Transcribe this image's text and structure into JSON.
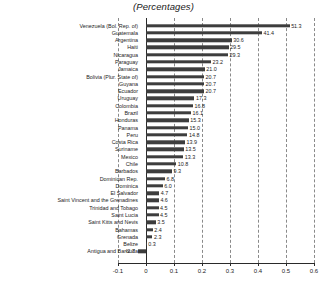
{
  "chart_data": {
    "type": "bar",
    "orientation": "horizontal",
    "title": "(Percentages)",
    "xlabel": "",
    "ylabel": "",
    "xlim": [
      -0.1,
      0.6
    ],
    "xticks": [
      "-0.1",
      "0",
      "0.1",
      "0.2",
      "0.3",
      "0.4",
      "0.5",
      "0.6"
    ],
    "xtick_values": [
      -0.1,
      0,
      0.1,
      0.2,
      0.3,
      0.4,
      0.5,
      0.6
    ],
    "grid": true,
    "legend": "none",
    "bar_color": "#3d3d3d",
    "categories": [
      "Venezuela (Bol. Rep. of)",
      "Guatemala",
      "Argentina",
      "Haiti",
      "Nicaragua",
      "Paraguay",
      "Jamaica",
      "Bolivia (Plur. State of)",
      "Guyana",
      "Ecuador",
      "Uruguay",
      "Colombia",
      "Brazil",
      "Honduras",
      "Panama",
      "Peru",
      "Costa Rica",
      "Suriname",
      "Mexico",
      "Chile",
      "Barbados",
      "Dominican Rep.",
      "Dominica",
      "El Salvador",
      "Saint Vincent and the Grenadines",
      "Trinidad and Tobago",
      "Saint Lucia",
      "Saint Kitts and Nevis",
      "Bahamas",
      "Grenada",
      "Belize",
      "Antigua and Barbuda"
    ],
    "values": [
      51.3,
      41.4,
      30.6,
      29.5,
      29.3,
      23.2,
      21.0,
      20.7,
      20.7,
      20.7,
      17.3,
      16.8,
      16.1,
      15.3,
      15.0,
      14.8,
      13.9,
      13.5,
      13.3,
      10.8,
      9.3,
      6.8,
      6.0,
      4.7,
      4.6,
      4.5,
      4.5,
      3.5,
      2.4,
      2.3,
      0.3,
      -2.7
    ],
    "value_labels": [
      "51.3",
      "41.4",
      "30.6",
      "29.5",
      "29.3",
      "23.2",
      "21.0",
      "20.7",
      "20.7",
      "20.7",
      "17.3",
      "16.8",
      "16.1",
      "15.3",
      "15.0",
      "14.8",
      "13.9",
      "13.5",
      "13.3",
      "10.8",
      "9.3",
      "6.8",
      "6.0",
      "4.7",
      "4.6",
      "4.5",
      "4.5",
      "3.5",
      "2.4",
      "2.3",
      "0.3",
      "-2.7"
    ]
  }
}
